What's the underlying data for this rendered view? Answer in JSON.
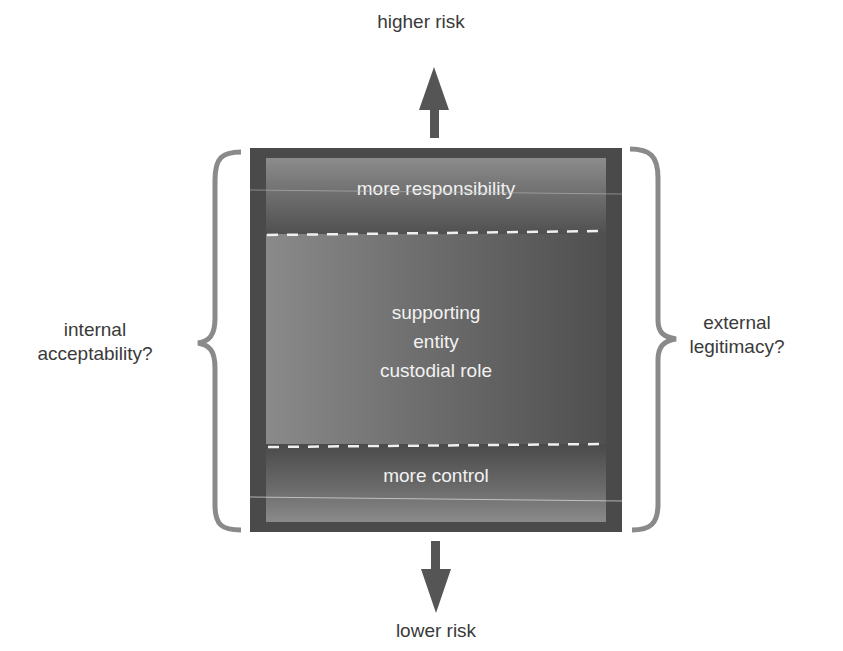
{
  "diagram": {
    "top_arrow_label": "higher risk",
    "bottom_arrow_label": "lower risk",
    "left_brace_label": [
      "internal",
      "acceptability?"
    ],
    "right_brace_label": [
      "external",
      "legitimacy?"
    ],
    "top_band": "more responsibility",
    "middle_band": [
      "supporting",
      "entity",
      "custodial role"
    ],
    "bottom_band": "more control",
    "colors": {
      "frame": "#4a4a4a",
      "arrow": "#555555",
      "brace": "#8a8a8a",
      "text": "#3a3a3a",
      "inner_text": "#f2f2f2"
    }
  }
}
